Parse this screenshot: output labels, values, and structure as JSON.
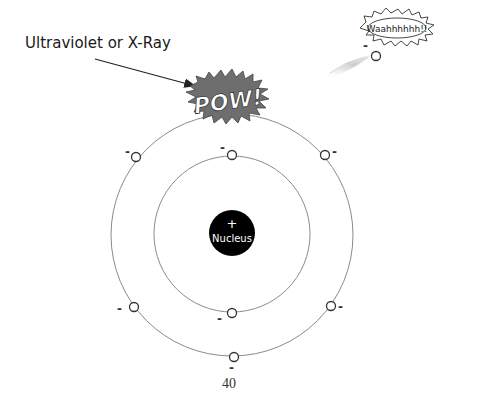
{
  "diagram": {
    "title_fragment": "",
    "incoming_radiation_label": "Ultraviolet or X-Ray",
    "impact_label": "POW!",
    "ejected_electron_exclamation": "Waahhhhhh!!",
    "nucleus": {
      "symbol": "+",
      "label": "Nucleus",
      "color": "#000000"
    },
    "electron_charge_symbol": "-",
    "shells": [
      {
        "name": "inner",
        "electrons": 2
      },
      {
        "name": "outer",
        "electrons": 6
      }
    ],
    "ejected_electrons": 1
  },
  "page": {
    "number": "40"
  },
  "colors": {
    "orbit": "#888888",
    "pow_fill": "#6e6e6e",
    "pow_text": "#ffffff",
    "streak": "#cfcfcf"
  }
}
